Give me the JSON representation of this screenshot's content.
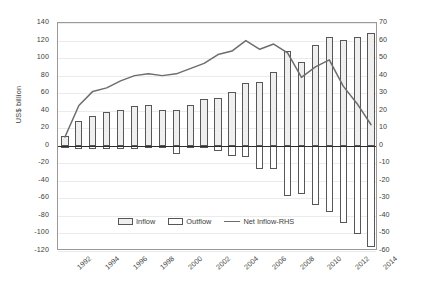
{
  "chart_data": {
    "type": "bar",
    "title": "",
    "subtitle": "",
    "xlabel": "",
    "ylabel": "US$ billion",
    "ylabel_right": "",
    "ylim": [
      -120,
      140
    ],
    "ylim_right": [
      -60,
      70
    ],
    "ytick_step": 20,
    "ytick_step_right": 10,
    "grid": true,
    "legend_position": "bottom-center",
    "categories": [
      1992,
      1993,
      1994,
      1995,
      1996,
      1997,
      1998,
      1999,
      2000,
      2001,
      2002,
      2003,
      2004,
      2005,
      2006,
      2007,
      2008,
      2009,
      2010,
      2011,
      2012,
      2013,
      2014
    ],
    "xtick_labels": [
      "1992",
      "1994",
      "1996",
      "1998",
      "2000",
      "2002",
      "2004",
      "2006",
      "2008",
      "2010",
      "2012",
      "2014"
    ],
    "yticks_left": [
      "140",
      "120",
      "100",
      "80",
      "60",
      "40",
      "20",
      "0",
      "-20",
      "-40",
      "-60",
      "-80",
      "-100",
      "-120"
    ],
    "yticks_right": [
      "70",
      "60",
      "50",
      "40",
      "30",
      "20",
      "10",
      "0",
      "-10",
      "-20",
      "-30",
      "-40",
      "-50",
      "-60"
    ],
    "series": [
      {
        "name": "Inflow",
        "type": "bar",
        "axis": "left",
        "values": [
          11,
          28,
          34,
          38,
          41,
          45,
          46,
          41,
          41,
          47,
          53,
          54,
          61,
          72,
          73,
          84,
          108,
          95,
          115,
          124,
          121,
          124,
          129
        ]
      },
      {
        "name": "Outflow",
        "type": "bar",
        "axis": "left",
        "values": [
          -2,
          -4,
          -4,
          -4,
          -4,
          -4,
          -3,
          -3,
          -9,
          -3,
          -3,
          -6,
          -12,
          -13,
          -26,
          -27,
          -57,
          -55,
          -67,
          -75,
          -88,
          -101,
          -116
        ]
      },
      {
        "name": "Net Inflow-RHS",
        "type": "line",
        "axis": "right",
        "values": [
          5,
          23,
          31,
          33,
          37,
          40,
          41,
          40,
          41,
          44,
          47,
          52,
          54,
          60,
          55,
          58,
          53,
          39,
          45,
          49,
          34,
          24,
          12
        ]
      }
    ]
  },
  "legend": {
    "items": [
      {
        "label": "Inflow",
        "marker": "inflow-swatch"
      },
      {
        "label": "Outflow",
        "marker": "outflow-swatch"
      },
      {
        "label": "Net Inflow-RHS",
        "marker": "line-swatch"
      }
    ]
  },
  "colors": {
    "inflow_fill": "#efefef",
    "inflow_border": "#575757",
    "outflow_fill": "#ffffff",
    "outflow_border": "#575757",
    "line": "#6d6d6d",
    "grid": "#ebebeb",
    "axis": "#9a9a9a",
    "zero_axis": "#2e2e2e",
    "text": "#3d3d3d"
  }
}
